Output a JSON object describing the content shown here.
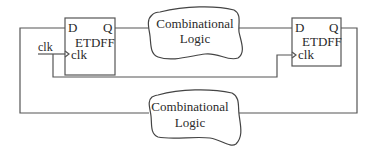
{
  "diagram": {
    "type": "circuit-block-diagram",
    "flipflops": [
      {
        "id": "ff1",
        "name": "ETDFF",
        "input_label": "D",
        "output_label": "Q",
        "clock_label": "clk"
      },
      {
        "id": "ff2",
        "name": "ETDFF",
        "input_label": "D",
        "output_label": "Q",
        "clock_label": "clk"
      }
    ],
    "logic_blocks": [
      {
        "id": "top",
        "line1": "Combinational",
        "line2": "Logic"
      },
      {
        "id": "bottom",
        "line1": "Combinational",
        "line2": "Logic"
      }
    ],
    "clock_input_label": "clk",
    "colors": {
      "stroke": "#555555",
      "text": "#2a2a2a",
      "background": "#ffffff"
    }
  }
}
